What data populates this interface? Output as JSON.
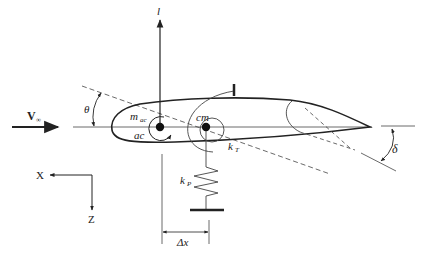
{
  "diagram": {
    "type": "airfoil-aeroelastic-model",
    "labels": {
      "freestream": "V",
      "freestream_sub": "∞",
      "lift": "l",
      "pitch_angle": "θ",
      "moment": "m",
      "moment_sub": "ac",
      "aero_center": "ac",
      "center_of_mass": "cm",
      "torsion_spring": "k",
      "torsion_spring_sub": "T",
      "plunge_spring": "k",
      "plunge_spring_sub": "P",
      "offset": "Δx",
      "flap_angle": "δ",
      "axis_x": "X",
      "axis_z": "Z"
    },
    "colors": {
      "stroke": "#222222",
      "background": "#ffffff"
    }
  }
}
